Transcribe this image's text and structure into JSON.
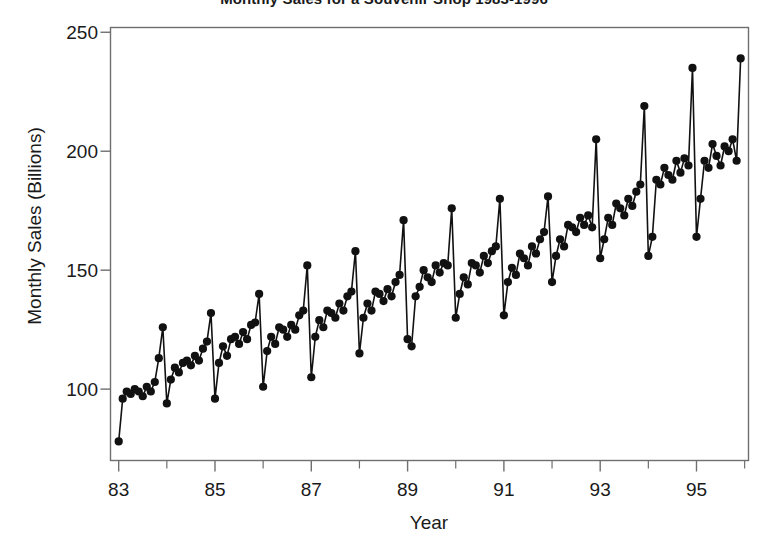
{
  "chart_data": {
    "type": "line",
    "title": "Monthly Sales for a Souvenir Shop 1983-1996",
    "xlabel": "Year",
    "ylabel": "Monthly Sales (Billions)",
    "grid": false,
    "legend": null,
    "marker": "filled-circle",
    "line_color": "#111111",
    "marker_color": "#111111",
    "xlim": [
      1982.83,
      1996.08
    ],
    "ylim": [
      70,
      252
    ],
    "xticks_major": [
      "83",
      "85",
      "87",
      "89",
      "91",
      "93",
      "95"
    ],
    "xticks_major_values": [
      1983,
      1985,
      1987,
      1989,
      1991,
      1993,
      1995
    ],
    "xticks_minor_values": [
      1984,
      1986,
      1988,
      1990,
      1992,
      1994,
      1996
    ],
    "yticks": [
      "100",
      "150",
      "200",
      "250"
    ],
    "ytick_values": [
      100,
      150,
      200,
      250
    ],
    "x_start_year": 1983,
    "x_start_month": 1,
    "values": [
      78,
      96,
      99,
      98,
      100,
      99,
      97,
      101,
      99,
      103,
      113,
      126,
      94,
      104,
      109,
      107,
      111,
      112,
      110,
      114,
      112,
      117,
      120,
      132,
      96,
      111,
      118,
      114,
      121,
      122,
      119,
      124,
      121,
      127,
      128,
      140,
      101,
      116,
      122,
      119,
      126,
      125,
      122,
      127,
      125,
      131,
      133,
      152,
      105,
      122,
      129,
      126,
      133,
      132,
      130,
      136,
      133,
      139,
      141,
      158,
      115,
      130,
      136,
      133,
      141,
      140,
      137,
      142,
      139,
      145,
      148,
      171,
      121,
      118,
      139,
      143,
      150,
      147,
      145,
      152,
      149,
      153,
      152,
      176,
      130,
      140,
      147,
      144,
      153,
      152,
      149,
      156,
      153,
      158,
      160,
      180,
      131,
      145,
      151,
      148,
      157,
      155,
      152,
      160,
      157,
      163,
      166,
      181,
      145,
      156,
      163,
      160,
      169,
      168,
      166,
      172,
      169,
      173,
      168,
      205,
      155,
      163,
      172,
      169,
      178,
      176,
      173,
      180,
      177,
      183,
      186,
      219,
      156,
      164,
      188,
      186,
      193,
      190,
      188,
      196,
      191,
      197,
      194,
      235,
      164,
      180,
      196,
      193,
      203,
      198,
      194,
      202,
      200,
      205,
      196,
      239
    ]
  },
  "axes": {
    "frame_color": "#6f6f6f",
    "tick_color": "#6f6f6f",
    "background": "#ffffff"
  }
}
